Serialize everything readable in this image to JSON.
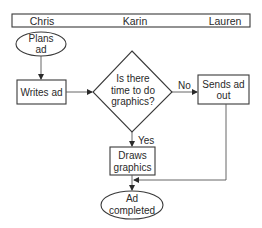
{
  "header": {
    "lanes": [
      {
        "label": "Chris"
      },
      {
        "label": "Karin"
      },
      {
        "label": "Lauren"
      }
    ]
  },
  "nodes": {
    "start": {
      "type": "terminator",
      "lines": [
        "Plans",
        "ad"
      ]
    },
    "write": {
      "type": "process",
      "lines": [
        "Writes ad"
      ]
    },
    "decision": {
      "type": "decision",
      "lines": [
        "Is there",
        "time to do",
        "graphics?"
      ]
    },
    "send": {
      "type": "process",
      "lines": [
        "Sends ad",
        "out"
      ]
    },
    "draw": {
      "type": "process",
      "lines": [
        "Draws",
        "graphics"
      ]
    },
    "end": {
      "type": "terminator",
      "lines": [
        "Ad",
        "completed"
      ]
    }
  },
  "edges": {
    "no_label": "No",
    "yes_label": "Yes"
  },
  "colors": {
    "stroke": "#3a3a3a",
    "text": "#2a2a2a",
    "background": "#ffffff"
  }
}
